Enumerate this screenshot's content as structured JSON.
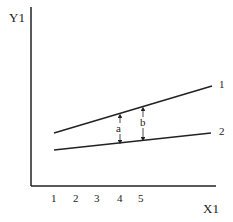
{
  "axes": {
    "y_label": "Y1",
    "x_label": "X1",
    "x_ticks": [
      "1",
      "2",
      "3",
      "4",
      "5"
    ]
  },
  "lines": [
    {
      "label": "1",
      "start": [
        54,
        133
      ],
      "end": [
        212,
        86
      ]
    },
    {
      "label": "2",
      "start": [
        54,
        150
      ],
      "end": [
        211,
        133
      ]
    }
  ],
  "arrows": [
    {
      "label": "a",
      "x": 120
    },
    {
      "label": "b",
      "x": 143
    }
  ],
  "colors": {
    "line": "#222222",
    "background": "#ffffff"
  }
}
